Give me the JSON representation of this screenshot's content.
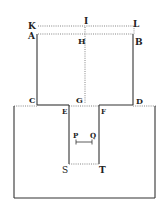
{
  "figure": {
    "type": "geometric diagram",
    "labels": {
      "K": "K",
      "I": "I",
      "L": "L",
      "A": "A",
      "H": "H",
      "B": "B",
      "C": "C",
      "G": "G",
      "D": "D",
      "E": "E",
      "F": "F",
      "P": "P",
      "Q": "Q",
      "S": "S",
      "T": "T"
    },
    "colors": {
      "ink": "#333333",
      "dotted": "#777777",
      "background": "#ffffff"
    }
  }
}
